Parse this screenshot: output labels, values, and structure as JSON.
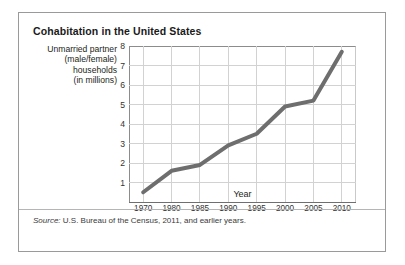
{
  "panel": {
    "title": "Cohabitation in the United States",
    "source_label": "Source:",
    "source_text": " U.S. Bureau of the Census, 2011, and earlier years."
  },
  "y_caption": {
    "line1": "Unmarried partner",
    "line2": "(male/female)",
    "line3": "households",
    "line4": "(in millions)"
  },
  "chart_data": {
    "type": "line",
    "title": "Cohabitation in the United States",
    "xlabel": "Year",
    "ylabel": "Unmarried partner (male/female) households (in millions)",
    "categories": [
      "1970",
      "1980",
      "1985",
      "1990",
      "1995",
      "2000",
      "2005",
      "2010"
    ],
    "values": [
      0.5,
      1.6,
      1.9,
      2.9,
      3.5,
      4.9,
      5.2,
      7.7
    ],
    "series": [
      {
        "name": "Unmarried partner households",
        "values": [
          0.5,
          1.6,
          1.9,
          2.9,
          3.5,
          4.9,
          5.2,
          7.7
        ],
        "color": "#6e6e6e"
      }
    ],
    "ylim": [
      0,
      8
    ],
    "yticks": [
      1,
      2,
      3,
      4,
      5,
      6,
      7,
      8
    ],
    "ytick_labels": [
      "1",
      "2",
      "3",
      "4",
      "5",
      "6",
      "7",
      "8"
    ],
    "xtick_labels": [
      "1970",
      "1980",
      "1985",
      "1990",
      "1995",
      "2000",
      "2005",
      "2010"
    ],
    "grid": "horizontal-and-vertical",
    "grid_color": "#d2d2d2",
    "legend": "none",
    "line_color": "#6e6e6e",
    "line_width": 4
  }
}
